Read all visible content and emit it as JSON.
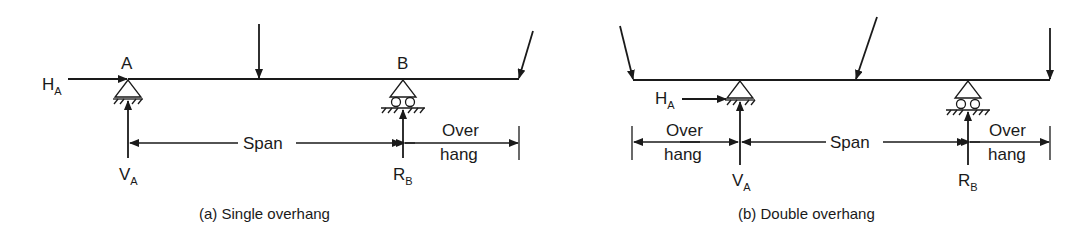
{
  "panels": [
    {
      "id": "a",
      "caption": "(a) Single overhang",
      "support_a": "A",
      "support_b": "B",
      "h_reaction": {
        "main": "H",
        "sub": "A"
      },
      "v_reaction_a": {
        "main": "V",
        "sub": "A"
      },
      "v_reaction_b": {
        "main": "R",
        "sub": "B"
      },
      "span_label": "Span",
      "overhang_right": [
        "Over",
        "hang"
      ]
    },
    {
      "id": "b",
      "caption": "(b) Double overhang",
      "h_reaction": {
        "main": "H",
        "sub": "A"
      },
      "v_reaction_a": {
        "main": "V",
        "sub": "A"
      },
      "v_reaction_b": {
        "main": "R",
        "sub": "B"
      },
      "span_label": "Span",
      "overhang_left": [
        "Over",
        "hang"
      ],
      "overhang_right": [
        "Over",
        "hang"
      ]
    }
  ]
}
